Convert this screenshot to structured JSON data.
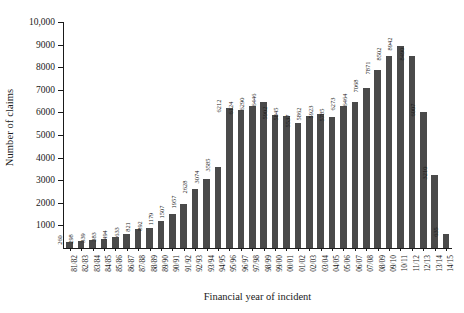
{
  "chart_data": {
    "type": "bar",
    "title": "",
    "xlabel": "Financial year of incident",
    "ylabel": "Number of claims",
    "ylim": [
      0,
      10000
    ],
    "ytick_labels": [
      "10,000",
      "9000",
      "8000",
      "7000",
      "6000",
      "5000",
      "4000",
      "3000",
      "2000",
      "1000"
    ],
    "ytick_values": [
      10000,
      9000,
      8000,
      7000,
      6000,
      5000,
      4000,
      3000,
      2000,
      1000
    ],
    "grid": false,
    "legend": false,
    "bar_color": "#4a4a4a",
    "axis_color": "#1a1a1a",
    "categories": [
      "81/82",
      "82/83",
      "83/84",
      "84/85",
      "85/86",
      "86/87",
      "87/88",
      "88/89",
      "89/90",
      "90/91",
      "91/92",
      "92/93",
      "93/94",
      "94/95",
      "95/96",
      "96/97",
      "97/98",
      "98/99",
      "99/00",
      "00/01",
      "01/02",
      "02/03",
      "03/04",
      "04/05",
      "05/06",
      "06/07",
      "07/08",
      "08/09",
      "09/10",
      "10/11",
      "11/12",
      "12/13",
      "13/14",
      "14/15"
    ],
    "values": [
      260,
      298,
      339,
      383,
      494,
      633,
      821,
      892,
      1179,
      1507,
      1957,
      2628,
      3074,
      3585,
      6212,
      6124,
      6290,
      6446,
      5902,
      5845,
      5537,
      5862,
      5923,
      5785,
      6273,
      6464,
      7068,
      7871,
      8502,
      8942,
      8490,
      6007,
      3210,
      635
    ]
  }
}
